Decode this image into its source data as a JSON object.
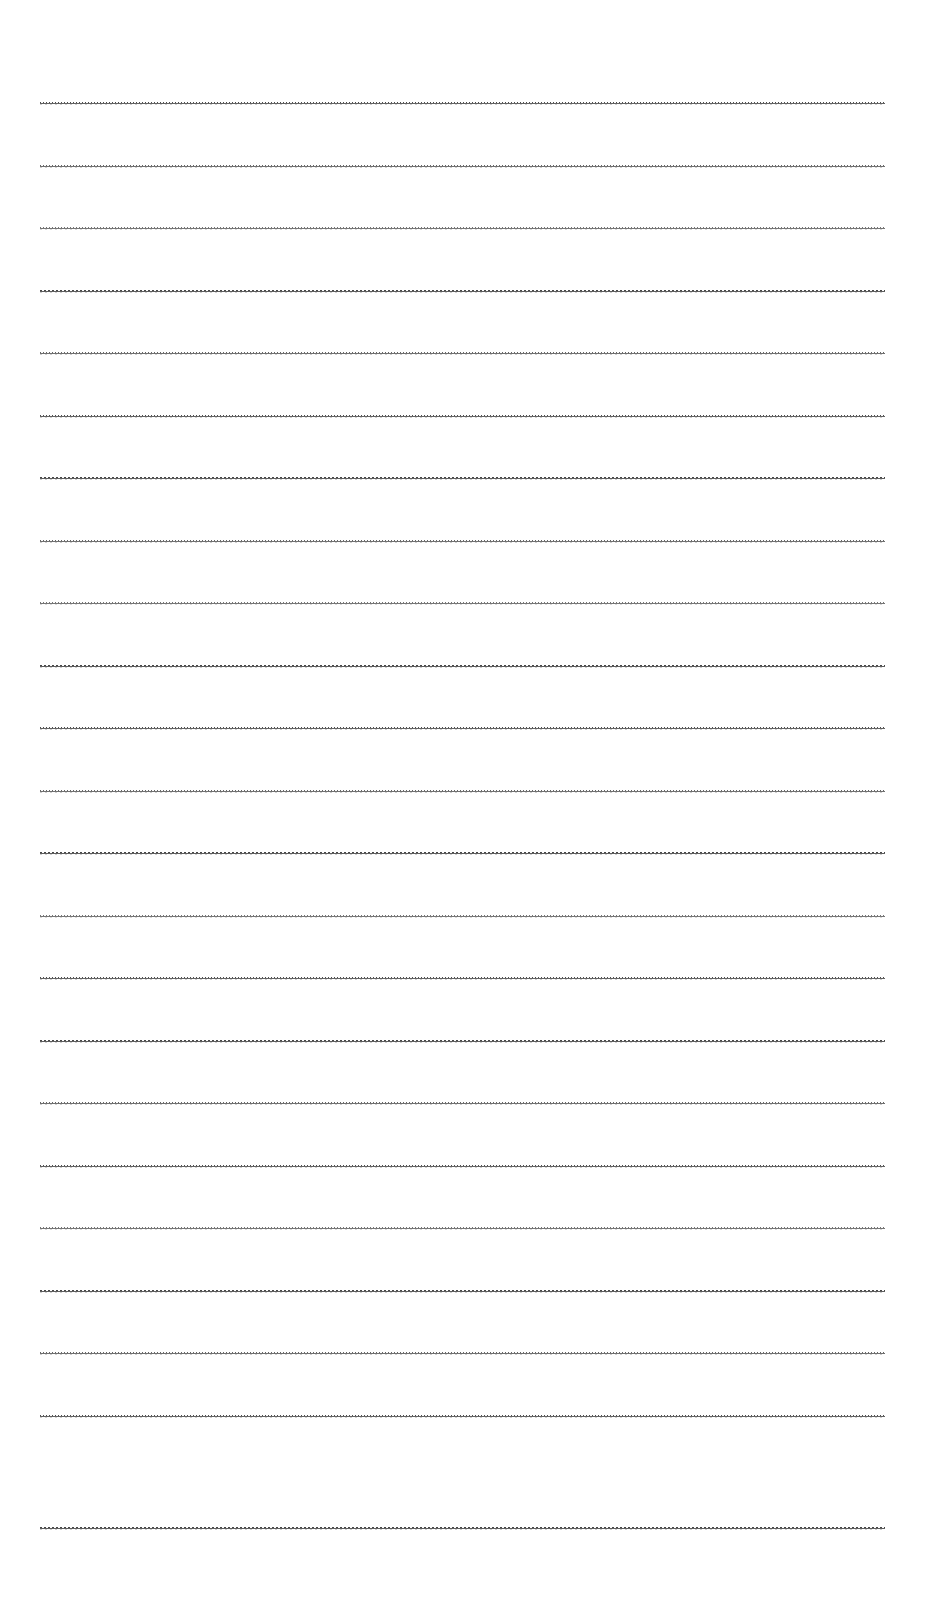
{
  "document": {
    "kind": "scanned-lined-paper",
    "title": "Blank Ruled Paper Scan",
    "page_width": 925,
    "page_height": 1597,
    "background_color": "#ffffff",
    "text_content": "",
    "has_handwriting": false,
    "has_printed_text": false
  },
  "ruling": {
    "line_color": "#6b6b6b",
    "line_accent_color": "#3a3a3a",
    "line_bleed_color": "#b9b9b9",
    "line_thickness_px": 1,
    "line_left_px": 40,
    "line_right_px": 885,
    "line_width_px": 845,
    "first_line_y_px": 103,
    "line_spacing_px": 62.5,
    "line_count": 23,
    "top_margin_px": 103,
    "bottom_margin_px": 69,
    "left_margin_px": 40,
    "right_margin_px": 40,
    "lines": [
      {
        "index": 1,
        "y": 103,
        "variant": "v2"
      },
      {
        "index": 2,
        "y": 166,
        "variant": "v1"
      },
      {
        "index": 3,
        "y": 228,
        "variant": "v3"
      },
      {
        "index": 4,
        "y": 291,
        "variant": "v4"
      },
      {
        "index": 5,
        "y": 353,
        "variant": "v1"
      },
      {
        "index": 6,
        "y": 416,
        "variant": "v2"
      },
      {
        "index": 7,
        "y": 478,
        "variant": "v4"
      },
      {
        "index": 8,
        "y": 541,
        "variant": "v1"
      },
      {
        "index": 9,
        "y": 603,
        "variant": "v3"
      },
      {
        "index": 10,
        "y": 666,
        "variant": "v4"
      },
      {
        "index": 11,
        "y": 728,
        "variant": "v2"
      },
      {
        "index": 12,
        "y": 791,
        "variant": "v1"
      },
      {
        "index": 13,
        "y": 853,
        "variant": "v4"
      },
      {
        "index": 14,
        "y": 916,
        "variant": "v3"
      },
      {
        "index": 15,
        "y": 978,
        "variant": "v2"
      },
      {
        "index": 16,
        "y": 1041,
        "variant": "v4"
      },
      {
        "index": 17,
        "y": 1103,
        "variant": "v1"
      },
      {
        "index": 18,
        "y": 1166,
        "variant": "v2"
      },
      {
        "index": 19,
        "y": 1228,
        "variant": "v3"
      },
      {
        "index": 20,
        "y": 1291,
        "variant": "v4"
      },
      {
        "index": 21,
        "y": 1353,
        "variant": "v1"
      },
      {
        "index": 22,
        "y": 1416,
        "variant": "v2"
      },
      {
        "index": 23,
        "y": 1528,
        "variant": "v4"
      }
    ]
  }
}
